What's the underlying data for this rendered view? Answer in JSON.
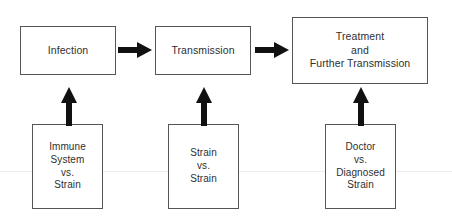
{
  "diagram": {
    "background_color": "#ffffff",
    "stroke_color": "#555555",
    "text_color": "#2f2f2f",
    "arrow_color": "#111111",
    "rule_color": "#ececec",
    "nodes": {
      "infection": {
        "label": "Infection"
      },
      "transmission": {
        "label": "Transmission"
      },
      "treatment": {
        "label": "Treatment\nand\nFurther Transmission"
      },
      "immune_vs_strain": {
        "label": "Immune\nSystem\nvs.\nStrain"
      },
      "strain_vs_strain": {
        "label": "Strain\nvs.\nStrain"
      },
      "doctor_vs_strain": {
        "label": "Doctor\nvs.\nDiagnosed\nStrain"
      }
    },
    "arrows": [
      {
        "name": "infection-to-transmission",
        "direction": "right"
      },
      {
        "name": "transmission-to-treatment",
        "direction": "right"
      },
      {
        "name": "immune-to-infection",
        "direction": "up"
      },
      {
        "name": "strain-to-transmission",
        "direction": "up"
      },
      {
        "name": "doctor-to-treatment",
        "direction": "up"
      }
    ]
  }
}
